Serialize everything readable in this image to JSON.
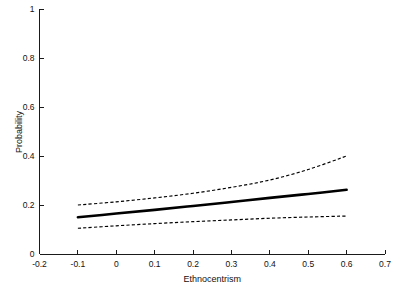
{
  "chart_data": {
    "type": "line",
    "title": "",
    "title_clipped": true,
    "xlabel": "Ethnocentrism",
    "ylabel": "Probability",
    "xlim": [
      -0.2,
      0.7
    ],
    "ylim": [
      0,
      1
    ],
    "xticks": [
      "-0.2",
      "-0.1",
      "0",
      "0.1",
      "0.2",
      "0.3",
      "0.4",
      "0.5",
      "0.6",
      "0.7"
    ],
    "xtick_values": [
      -0.2,
      -0.1,
      0,
      0.1,
      0.2,
      0.3,
      0.4,
      0.5,
      0.6,
      0.7
    ],
    "yticks": [
      "0",
      "0.2",
      "0.4",
      "0.6",
      "0.8",
      "1"
    ],
    "ytick_values": [
      0,
      0.2,
      0.4,
      0.6,
      0.8,
      1
    ],
    "grid": false,
    "legend": "none",
    "frame": "open-left-bottom",
    "x": [
      -0.1,
      0.0,
      0.1,
      0.2,
      0.3,
      0.4,
      0.5,
      0.6
    ],
    "series": [
      {
        "name": "Predicted probability",
        "style": "solid",
        "color": "#000000",
        "values": [
          0.15,
          0.165,
          0.18,
          0.196,
          0.212,
          0.229,
          0.245,
          0.262
        ]
      },
      {
        "name": "Upper 95% confidence bound",
        "style": "dashed",
        "color": "#000000",
        "values": [
          0.2,
          0.213,
          0.229,
          0.248,
          0.272,
          0.302,
          0.345,
          0.4
        ]
      },
      {
        "name": "Lower 95% confidence bound",
        "style": "dashed",
        "color": "#000000",
        "values": [
          0.105,
          0.115,
          0.124,
          0.132,
          0.139,
          0.146,
          0.151,
          0.155
        ]
      }
    ]
  },
  "axes": {
    "xlabel": "Ethnocentrism",
    "ylabel": "Probability"
  }
}
